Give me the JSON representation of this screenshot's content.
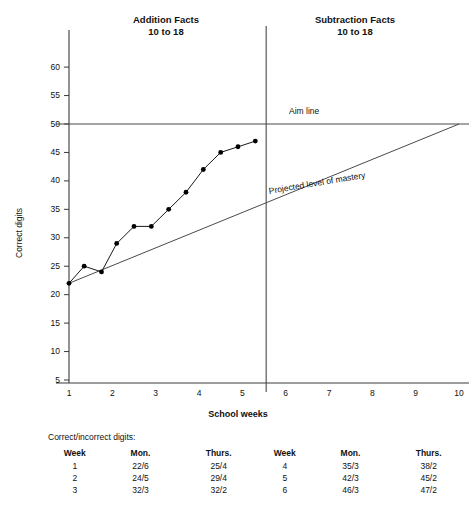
{
  "phases": {
    "left": {
      "title": "Addition Facts",
      "range": "10 to 18"
    },
    "right": {
      "title": "Subtraction Facts",
      "range": "10 to 18"
    }
  },
  "axes": {
    "y_title": "Correct digits",
    "x_title": "School weeks",
    "y_ticks": [
      5,
      10,
      15,
      20,
      25,
      30,
      35,
      40,
      45,
      50,
      55,
      60
    ],
    "x_ticks": [
      1,
      2,
      3,
      4,
      5,
      6,
      7,
      8,
      9,
      10
    ]
  },
  "annotations": {
    "aim_line": "Aim line",
    "mastery_line": "Projected level of mastery"
  },
  "table": {
    "caption": "Correct/incorrect digits:",
    "headers": [
      "Week",
      "Mon.",
      "Thurs.",
      "Week",
      "Mon.",
      "Thurs."
    ],
    "rows": [
      [
        "1",
        "22/6",
        "25/4",
        "4",
        "35/3",
        "38/2"
      ],
      [
        "2",
        "24/5",
        "29/4",
        "5",
        "42/3",
        "45/2"
      ],
      [
        "3",
        "32/3",
        "32/2",
        "6",
        "46/3",
        "47/2"
      ]
    ]
  },
  "chart_data": {
    "type": "line",
    "title": "",
    "xlabel": "School weeks",
    "ylabel": "Correct digits",
    "xlim": [
      0.6,
      10.2
    ],
    "ylim": [
      5,
      62
    ],
    "grid": false,
    "legend": "none",
    "series": [
      {
        "name": "Correct digits",
        "x": [
          1.0,
          1.35,
          1.75,
          2.1,
          2.5,
          2.9,
          3.3,
          3.7,
          4.1,
          4.5,
          4.9,
          5.3
        ],
        "y": [
          22,
          25,
          24,
          29,
          32,
          32,
          35,
          38,
          42,
          45,
          46,
          47
        ],
        "markers": true
      }
    ],
    "reference_lines": [
      {
        "name": "Aim line",
        "type": "horizontal",
        "y": 50
      },
      {
        "name": "Projected level of mastery",
        "type": "segment",
        "x0": 1,
        "y0": 22,
        "x1": 10,
        "y1": 50
      },
      {
        "name": "Phase change line",
        "type": "vertical",
        "x": 5.55
      }
    ]
  },
  "colors": {
    "axis": "#3a3a3a",
    "line": "#1a1a1a",
    "marker": "#000000",
    "reference": "#4a4a4a",
    "text": "#111111"
  }
}
